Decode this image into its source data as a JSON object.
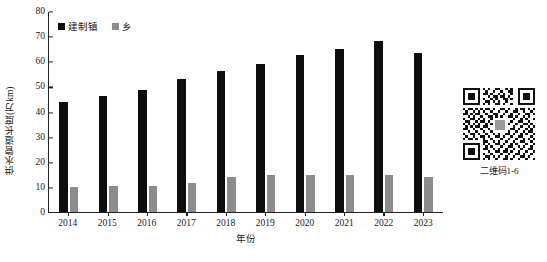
{
  "chart_data": {
    "type": "bar",
    "title": "",
    "xlabel": "年份",
    "ylabel": "供水管道长度(万km)",
    "ylim": [
      0,
      80
    ],
    "yticks": [
      0,
      10,
      20,
      30,
      40,
      50,
      60,
      70,
      80
    ],
    "grid": false,
    "legend_position": "top-left",
    "categories": [
      "2014",
      "2015",
      "2016",
      "2017",
      "2018",
      "2019",
      "2020",
      "2021",
      "2022",
      "2023"
    ],
    "series": [
      {
        "name": "建制镇",
        "color": "#0d0d0d",
        "values": [
          43.7,
          46.2,
          48.5,
          53.0,
          56.0,
          59.0,
          62.3,
          64.8,
          68.2,
          63.2
        ]
      },
      {
        "name": "乡",
        "color": "#8c8c8c",
        "values": [
          9.8,
          10.2,
          10.5,
          11.7,
          14.0,
          14.8,
          14.9,
          14.6,
          14.9,
          14.1
        ]
      }
    ]
  },
  "qr": {
    "caption": "二维码1-6",
    "icon": "qr-code-icon"
  }
}
